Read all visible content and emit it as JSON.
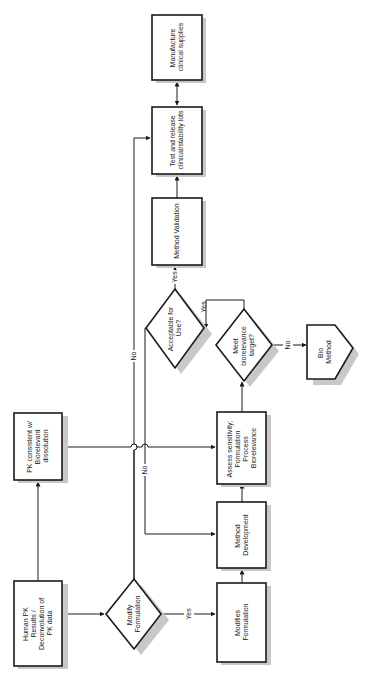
{
  "diagram": {
    "orientation": "rotated-90-ccw",
    "nodes": {
      "human_pk": {
        "type": "process",
        "lines": [
          "Human PK",
          "Results /",
          "Deconvolution of",
          "PK data"
        ]
      },
      "pk_consistent": {
        "type": "process",
        "lines": [
          "PK consistent w/",
          "Biorelevant",
          "dissolution"
        ]
      },
      "modify_formulation": {
        "type": "decision",
        "lines": [
          "Modify",
          "Formulation"
        ]
      },
      "modifies_formulation": {
        "type": "process",
        "lines": [
          "Modifies",
          "Formulation"
        ]
      },
      "method_development": {
        "type": "process",
        "lines": [
          "Method",
          "Development"
        ]
      },
      "assess_sensitivity": {
        "type": "process",
        "lines": [
          "Assess sensitivity;",
          "Formulation",
          "Process",
          "Biorelevance"
        ]
      },
      "acceptable_for_use": {
        "type": "decision",
        "lines": [
          "Acceptable for",
          "Use?"
        ]
      },
      "meet_biorelevance": {
        "type": "decision",
        "lines": [
          "Meet",
          "biorelevance",
          "target?"
        ]
      },
      "bio_method": {
        "type": "offpage",
        "lines": [
          "Bio",
          "Method"
        ]
      },
      "method_validation": {
        "type": "process",
        "lines": [
          "Method Validation"
        ]
      },
      "test_release": {
        "type": "process",
        "lines": [
          "Test and release",
          "clinical/stability lots"
        ]
      },
      "manufacture": {
        "type": "process",
        "lines": [
          "Manufacture",
          "clinical supplies"
        ]
      }
    },
    "edges": [
      {
        "from": "human_pk",
        "to": "pk_consistent",
        "label": ""
      },
      {
        "from": "human_pk",
        "to": "modify_formulation",
        "label": ""
      },
      {
        "from": "modify_formulation",
        "to": "modifies_formulation",
        "label": "Yes"
      },
      {
        "from": "modify_formulation",
        "to": "test_release",
        "label": "No"
      },
      {
        "from": "modifies_formulation",
        "to": "method_development",
        "label": ""
      },
      {
        "from": "method_development",
        "to": "assess_sensitivity",
        "label": ""
      },
      {
        "from": "pk_consistent",
        "to": "assess_sensitivity",
        "label": ""
      },
      {
        "from": "assess_sensitivity",
        "to": "meet_biorelevance",
        "label": ""
      },
      {
        "from": "meet_biorelevance",
        "to": "bio_method",
        "label": "No"
      },
      {
        "from": "meet_biorelevance",
        "to": "acceptable_for_use",
        "label": "Yes"
      },
      {
        "from": "acceptable_for_use",
        "to": "method_validation",
        "label": "Yes"
      },
      {
        "from": "acceptable_for_use",
        "to": "method_development",
        "label": "No"
      },
      {
        "from": "method_validation",
        "to": "test_release",
        "label": ""
      },
      {
        "from": "test_release",
        "to": "manufacture",
        "label": "",
        "bidirectional": true
      }
    ],
    "edge_labels": {
      "yes_modify": "Yes",
      "no_modify": "No",
      "no_acceptable": "No",
      "yes_acceptable": "Yes",
      "yes_meet": "Yes",
      "no_meet": "No"
    },
    "colors": {
      "stroke": "#1a1a1a",
      "shadow": "#c8c8c8",
      "background": "#ffffff"
    }
  }
}
